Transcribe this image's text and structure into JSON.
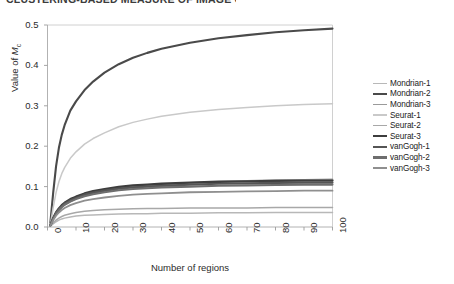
{
  "top_clipped_title": "CLUSTERING-BASED MEASURE OF IMAGE COMPLEXITY",
  "axes": {
    "y_title_prefix": "Value of ",
    "y_title_symbol": "M",
    "y_title_subscript": "c",
    "x_title": "Number of regions"
  },
  "legend": {
    "items": [
      {
        "label": "Mondrian-1",
        "color": "#b8b8b8",
        "width": 1.5
      },
      {
        "label": "Mondrian-2",
        "color": "#4a4a4a",
        "width": 2.1
      },
      {
        "label": "Mondrian-3",
        "color": "#9a9a9a",
        "width": 1.7
      },
      {
        "label": "Seurat-1",
        "color": "#c9c9c9",
        "width": 1.5
      },
      {
        "label": "Seurat-2",
        "color": "#a8a8a8",
        "width": 1.5
      },
      {
        "label": "Seurat-3",
        "color": "#3d3d3d",
        "width": 2.3
      },
      {
        "label": "vanGogh-1",
        "color": "#555555",
        "width": 2.2
      },
      {
        "label": "vanGogh-2",
        "color": "#6e6e6e",
        "width": 2.1
      },
      {
        "label": "vanGogh-3",
        "color": "#8f8f8f",
        "width": 1.8
      }
    ]
  },
  "chart_data": {
    "type": "line",
    "title": "",
    "xlabel": "Number of regions",
    "ylabel": "Value of Mc",
    "xlim": [
      0,
      100
    ],
    "ylim": [
      0,
      0.5
    ],
    "xticks": [
      0,
      10,
      20,
      30,
      40,
      50,
      60,
      70,
      80,
      90,
      100
    ],
    "yticks": [
      0.0,
      0.1,
      0.2,
      0.3,
      0.4,
      0.5
    ],
    "ytick_labels": [
      "0.0",
      "0.1",
      "0.2",
      "0.3",
      "0.4",
      "0.5"
    ],
    "xtick_labels": [
      "0",
      "10",
      "20",
      "30",
      "40",
      "50",
      "60",
      "70",
      "80",
      "90",
      "100"
    ],
    "grid": false,
    "legend_position": "right-outside",
    "x": [
      1,
      2,
      3,
      4,
      5,
      6,
      8,
      10,
      13,
      16,
      20,
      25,
      30,
      35,
      40,
      50,
      60,
      70,
      80,
      90,
      100
    ],
    "series": [
      {
        "name": "Mondrian-1",
        "color": "#b8b8b8",
        "values": [
          0.002,
          0.008,
          0.013,
          0.017,
          0.02,
          0.022,
          0.025,
          0.027,
          0.029,
          0.03,
          0.031,
          0.032,
          0.033,
          0.033,
          0.034,
          0.034,
          0.035,
          0.035,
          0.036,
          0.036,
          0.036
        ]
      },
      {
        "name": "Mondrian-2",
        "color": "#4a4a4a",
        "values": [
          0.01,
          0.085,
          0.15,
          0.196,
          0.228,
          0.252,
          0.288,
          0.311,
          0.339,
          0.36,
          0.382,
          0.403,
          0.419,
          0.431,
          0.441,
          0.456,
          0.467,
          0.475,
          0.482,
          0.487,
          0.491
        ]
      },
      {
        "name": "Mondrian-3",
        "color": "#9a9a9a",
        "values": [
          0.004,
          0.02,
          0.033,
          0.042,
          0.049,
          0.055,
          0.063,
          0.07,
          0.078,
          0.084,
          0.09,
          0.096,
          0.1,
          0.103,
          0.105,
          0.109,
          0.112,
          0.114,
          0.116,
          0.117,
          0.118
        ]
      },
      {
        "name": "Seurat-1",
        "color": "#c9c9c9",
        "values": [
          0.006,
          0.048,
          0.085,
          0.112,
          0.132,
          0.147,
          0.17,
          0.186,
          0.205,
          0.219,
          0.233,
          0.248,
          0.259,
          0.267,
          0.274,
          0.284,
          0.291,
          0.296,
          0.3,
          0.303,
          0.305
        ]
      },
      {
        "name": "Seurat-2",
        "color": "#a8a8a8",
        "values": [
          0.002,
          0.01,
          0.017,
          0.022,
          0.026,
          0.029,
          0.033,
          0.036,
          0.039,
          0.041,
          0.043,
          0.044,
          0.045,
          0.046,
          0.046,
          0.047,
          0.047,
          0.047,
          0.048,
          0.048,
          0.048
        ]
      },
      {
        "name": "Seurat-3",
        "color": "#3d3d3d",
        "values": [
          0.004,
          0.022,
          0.036,
          0.046,
          0.054,
          0.06,
          0.069,
          0.075,
          0.083,
          0.089,
          0.094,
          0.099,
          0.103,
          0.105,
          0.107,
          0.11,
          0.112,
          0.113,
          0.114,
          0.115,
          0.115
        ]
      },
      {
        "name": "vanGogh-1",
        "color": "#555555",
        "values": [
          0.004,
          0.021,
          0.035,
          0.044,
          0.052,
          0.058,
          0.066,
          0.072,
          0.08,
          0.085,
          0.09,
          0.095,
          0.098,
          0.1,
          0.102,
          0.105,
          0.107,
          0.108,
          0.109,
          0.11,
          0.11
        ]
      },
      {
        "name": "vanGogh-2",
        "color": "#6e6e6e",
        "values": [
          0.004,
          0.02,
          0.033,
          0.042,
          0.049,
          0.055,
          0.063,
          0.069,
          0.076,
          0.081,
          0.086,
          0.091,
          0.094,
          0.096,
          0.098,
          0.1,
          0.102,
          0.103,
          0.104,
          0.105,
          0.105
        ]
      },
      {
        "name": "vanGogh-3",
        "color": "#8f8f8f",
        "values": [
          0.003,
          0.017,
          0.028,
          0.036,
          0.042,
          0.047,
          0.054,
          0.059,
          0.065,
          0.069,
          0.073,
          0.077,
          0.08,
          0.082,
          0.083,
          0.086,
          0.087,
          0.088,
          0.089,
          0.09,
          0.09
        ]
      }
    ]
  }
}
